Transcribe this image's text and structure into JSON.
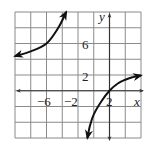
{
  "chart_data": {
    "type": "line",
    "title": "",
    "xlabel": "x",
    "ylabel": "y",
    "xlim": [
      -12,
      4
    ],
    "ylim": [
      -6,
      10
    ],
    "grid": true,
    "grid_step": 2,
    "x_tick_labels": [
      "-6",
      "-2",
      "2"
    ],
    "y_tick_labels": [
      "6",
      "2"
    ],
    "legend": null,
    "series": [
      {
        "name": "left branch",
        "x": [
          -12,
          -10,
          -8,
          -6.5,
          -5.5
        ],
        "y": [
          4.4,
          5.0,
          6.0,
          8.0,
          10.0
        ],
        "arrow_ends": true
      },
      {
        "name": "right branch",
        "x": [
          -2.8,
          -2.5,
          -2,
          -1,
          0,
          1,
          2,
          3,
          4
        ],
        "y": [
          -6.0,
          -4.5,
          -3.0,
          -1.3,
          0.0,
          0.9,
          1.4,
          1.75,
          1.95
        ],
        "arrow_ends": true
      }
    ]
  },
  "labels": {
    "x_axis": "x",
    "y_axis": "y",
    "x_ticks": [
      {
        "text": "−6",
        "value": -6
      },
      {
        "text": "−2",
        "value": -2
      },
      {
        "text": "2",
        "value": 2
      }
    ],
    "y_ticks": [
      {
        "text": "6",
        "value": 6
      },
      {
        "text": "2",
        "value": 2
      }
    ]
  }
}
